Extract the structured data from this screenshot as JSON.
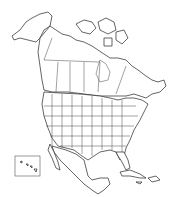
{
  "map": {
    "subject": "North America outline map",
    "regions": [
      "Alaska",
      "Canada",
      "United States",
      "Mexico",
      "Central America",
      "Caribbean",
      "Greenland edge",
      "Hawaii inset"
    ],
    "style": {
      "land_fill": "#ffffff",
      "outline_color": "#222222",
      "background": "#ffffff"
    },
    "inset": {
      "label": "Hawaii",
      "present": true
    }
  }
}
